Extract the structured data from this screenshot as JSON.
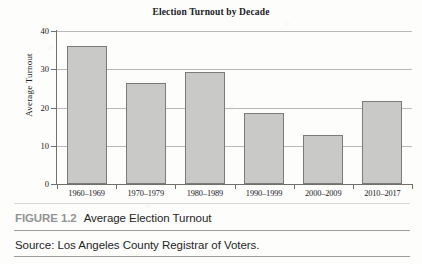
{
  "figure": {
    "number_label": "FIGURE 1.2",
    "caption": "Average Election Turnout",
    "source": "Source: Los Angeles County Registrar of Voters."
  },
  "chart_data": {
    "type": "bar",
    "title": "Election Turnout by Decade",
    "xlabel": "",
    "ylabel": "Average Turnout",
    "categories": [
      "1960–1969",
      "1970–1979",
      "1980–1989",
      "1990–1999",
      "2000–2009",
      "2010–2017"
    ],
    "values": [
      36.0,
      26.3,
      29.4,
      18.5,
      12.8,
      21.8
    ],
    "ylim": [
      0,
      40
    ],
    "yticks": [
      0,
      10,
      20,
      30,
      40
    ],
    "ytick_labels": [
      "0",
      "10",
      "20",
      "30",
      "40"
    ],
    "grid": "horizontal",
    "legend": "none",
    "bar_color": "#c9c9c7",
    "bar_edge_color": "#7a7a77",
    "axis_color": "#6f6f6c",
    "gridline_color": "#b9b9b6"
  }
}
